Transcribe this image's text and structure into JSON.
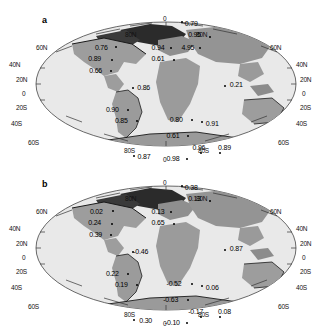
{
  "figure": {
    "type": "two-panel-world-map-scatter-annotation",
    "background": "#ffffff",
    "ocean_color": "#e8e8e8",
    "land_color": "#a0a0a0",
    "outline_color": "#333333"
  },
  "panels": [
    {
      "id": "a",
      "label": "a",
      "projection": "Mollweide-like (Hammer/Aitoff globe outline)",
      "graticule_labels_left": [
        "60N",
        "40N",
        "20N",
        "0",
        "20S",
        "40S",
        "60S"
      ],
      "graticule_labels_right": [
        "60N",
        "40N",
        "20N",
        "0",
        "20S",
        "40S",
        "60S"
      ],
      "graticule_labels_top": [
        "80N",
        "0",
        "80N"
      ],
      "graticule_labels_bottom": [
        "80S",
        "0",
        "80S"
      ],
      "values": [
        {
          "text": "0.79",
          "x": 0.555,
          "y": 0.145,
          "dot_x": 0.545,
          "dot_y": 0.125
        },
        {
          "text": "0.95",
          "x": 0.565,
          "y": 0.215,
          "dot_x": 0.628,
          "dot_y": 0.218
        },
        {
          "text": "0.94",
          "x": 0.455,
          "y": 0.29,
          "dot_x": 0.512,
          "dot_y": 0.288
        },
        {
          "text": "4.95",
          "x": 0.545,
          "y": 0.29,
          "dot_x": 0.598,
          "dot_y": 0.285
        },
        {
          "text": "0.76",
          "x": 0.285,
          "y": 0.29,
          "dot_x": 0.345,
          "dot_y": 0.282
        },
        {
          "text": "0.61",
          "x": 0.455,
          "y": 0.36,
          "dot_x": 0.52,
          "dot_y": 0.358
        },
        {
          "text": "0.89",
          "x": 0.265,
          "y": 0.36,
          "dot_x": 0.332,
          "dot_y": 0.358
        },
        {
          "text": "0.66",
          "x": 0.268,
          "y": 0.43,
          "dot_x": 0.33,
          "dot_y": 0.425
        },
        {
          "text": "0.86",
          "x": 0.412,
          "y": 0.535,
          "dot_x": 0.396,
          "dot_y": 0.53
        },
        {
          "text": "0.21",
          "x": 0.69,
          "y": 0.52,
          "dot_x": 0.674,
          "dot_y": 0.516
        },
        {
          "text": "0.90",
          "x": 0.318,
          "y": 0.67,
          "dot_x": 0.382,
          "dot_y": 0.666
        },
        {
          "text": "0.85",
          "x": 0.345,
          "y": 0.735,
          "dot_x": 0.408,
          "dot_y": 0.73
        },
        {
          "text": "0.80",
          "x": 0.51,
          "y": 0.732,
          "dot_x": 0.573,
          "dot_y": 0.728
        },
        {
          "text": "0.91",
          "x": 0.618,
          "y": 0.755,
          "dot_x": 0.604,
          "dot_y": 0.736
        },
        {
          "text": "0.61",
          "x": 0.5,
          "y": 0.828,
          "dot_x": 0.562,
          "dot_y": 0.824
        },
        {
          "text": "0.96",
          "x": 0.578,
          "y": 0.905,
          "dot_x": 0.6,
          "dot_y": 0.928
        },
        {
          "text": "0.89",
          "x": 0.655,
          "y": 0.905,
          "dot_x": 0.658,
          "dot_y": 0.928
        },
        {
          "text": "0.87",
          "x": 0.413,
          "y": 0.955,
          "dot_x": 0.4,
          "dot_y": 0.948
        },
        {
          "text": "0.98",
          "x": 0.5,
          "y": 0.968,
          "dot_x": 0.56,
          "dot_y": 0.962
        }
      ]
    },
    {
      "id": "b",
      "label": "b",
      "projection": "Mollweide-like (Hammer/Aitoff globe outline)",
      "graticule_labels_left": [
        "60N",
        "40N",
        "20N",
        "0",
        "20S",
        "40S",
        "60S"
      ],
      "graticule_labels_right": [
        "60N",
        "40N",
        "20N",
        "0",
        "20S",
        "40S",
        "60S"
      ],
      "graticule_labels_top": [
        "80N",
        "0",
        "80N"
      ],
      "graticule_labels_bottom": [
        "80S",
        "0",
        "80S"
      ],
      "values": [
        {
          "text": "0.38",
          "x": 0.555,
          "y": 0.145,
          "dot_x": 0.545,
          "dot_y": 0.125
        },
        {
          "text": "0.13",
          "x": 0.565,
          "y": 0.215,
          "dot_x": 0.628,
          "dot_y": 0.218
        },
        {
          "text": "0.13",
          "x": 0.455,
          "y": 0.29,
          "dot_x": 0.512,
          "dot_y": 0.288
        },
        {
          "text": "0.02",
          "x": 0.27,
          "y": 0.29,
          "dot_x": 0.335,
          "dot_y": 0.282
        },
        {
          "text": "0.24",
          "x": 0.265,
          "y": 0.36,
          "dot_x": 0.332,
          "dot_y": 0.358
        },
        {
          "text": "0.65",
          "x": 0.455,
          "y": 0.36,
          "dot_x": 0.52,
          "dot_y": 0.358
        },
        {
          "text": "0.39",
          "x": 0.268,
          "y": 0.43,
          "dot_x": 0.33,
          "dot_y": 0.425
        },
        {
          "text": "-0.46",
          "x": 0.4,
          "y": 0.535,
          "dot_x": 0.396,
          "dot_y": 0.53
        },
        {
          "text": "0.87",
          "x": 0.69,
          "y": 0.52,
          "dot_x": 0.674,
          "dot_y": 0.516
        },
        {
          "text": "0.22",
          "x": 0.318,
          "y": 0.67,
          "dot_x": 0.382,
          "dot_y": 0.666
        },
        {
          "text": "0.19",
          "x": 0.345,
          "y": 0.735,
          "dot_x": 0.408,
          "dot_y": 0.73
        },
        {
          "text": "-0.52",
          "x": 0.5,
          "y": 0.732,
          "dot_x": 0.573,
          "dot_y": 0.728
        },
        {
          "text": "0.06",
          "x": 0.618,
          "y": 0.755,
          "dot_x": 0.604,
          "dot_y": 0.736
        },
        {
          "text": "-0.63",
          "x": 0.49,
          "y": 0.828,
          "dot_x": 0.562,
          "dot_y": 0.824
        },
        {
          "text": "-0.17",
          "x": 0.565,
          "y": 0.905,
          "dot_x": 0.6,
          "dot_y": 0.928
        },
        {
          "text": "0.08",
          "x": 0.655,
          "y": 0.905,
          "dot_x": 0.658,
          "dot_y": 0.928
        },
        {
          "text": "0.30",
          "x": 0.418,
          "y": 0.955,
          "dot_x": 0.4,
          "dot_y": 0.948
        },
        {
          "text": "-0.10",
          "x": 0.495,
          "y": 0.968,
          "dot_x": 0.56,
          "dot_y": 0.962
        }
      ]
    }
  ]
}
